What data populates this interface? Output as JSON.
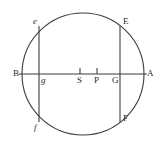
{
  "figure": {
    "kind": "geometry-diagram",
    "background_color": "#ffffff",
    "stroke_color": "#3c3c3c",
    "label_color": "#2a2a2a",
    "circle": {
      "center_x": 83,
      "center_y": 74,
      "radius": 61
    },
    "diameter": {
      "name": "BA",
      "y": 74,
      "x_start": 19,
      "x_end": 147
    },
    "chords": [
      {
        "name": "ef",
        "x": 39,
        "y_top": 26,
        "y_bottom": 122
      },
      {
        "name": "EF",
        "x": 120,
        "y_top": 26,
        "y_bottom": 122
      }
    ],
    "ticks": [
      {
        "name": "S",
        "x": 80,
        "y_top": 68,
        "y_bottom": 74
      },
      {
        "name": "P",
        "x": 97,
        "y_top": 68,
        "y_bottom": 74
      }
    ],
    "labels": [
      {
        "id": "e",
        "text": "e",
        "x": 33,
        "y": 17,
        "italic": true
      },
      {
        "id": "E",
        "text": "E",
        "x": 123,
        "y": 17,
        "italic": false
      },
      {
        "id": "B",
        "text": "B",
        "x": 13,
        "y": 69,
        "italic": false
      },
      {
        "id": "g",
        "text": "g",
        "x": 41,
        "y": 76,
        "italic": true
      },
      {
        "id": "S",
        "text": "S",
        "x": 77,
        "y": 76,
        "italic": false
      },
      {
        "id": "P",
        "text": "P",
        "x": 94,
        "y": 76,
        "italic": false
      },
      {
        "id": "G",
        "text": "G",
        "x": 112,
        "y": 76,
        "italic": false
      },
      {
        "id": "A",
        "text": "A",
        "x": 147,
        "y": 69,
        "italic": false
      },
      {
        "id": "f",
        "text": "f",
        "x": 34,
        "y": 123,
        "italic": true
      },
      {
        "id": "F",
        "text": "F",
        "x": 123,
        "y": 114,
        "italic": false
      }
    ]
  }
}
